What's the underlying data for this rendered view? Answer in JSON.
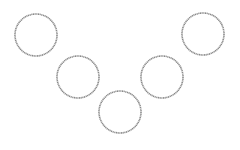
{
  "canvas": {
    "width": 240,
    "height": 150,
    "background": "#ffffff"
  },
  "style": {
    "stroke_color": "#8a8a8a",
    "stroke_width": 1.6,
    "fill": "none"
  },
  "circles": [
    {
      "id": "circle-1",
      "cx": 36,
      "cy": 35,
      "r": 21
    },
    {
      "id": "circle-2",
      "cx": 78,
      "cy": 77,
      "r": 21
    },
    {
      "id": "circle-3",
      "cx": 120,
      "cy": 112,
      "r": 21
    },
    {
      "id": "circle-4",
      "cx": 162,
      "cy": 77,
      "r": 21
    },
    {
      "id": "circle-5",
      "cx": 203,
      "cy": 34,
      "r": 21
    }
  ],
  "arrangement": "v-shape"
}
